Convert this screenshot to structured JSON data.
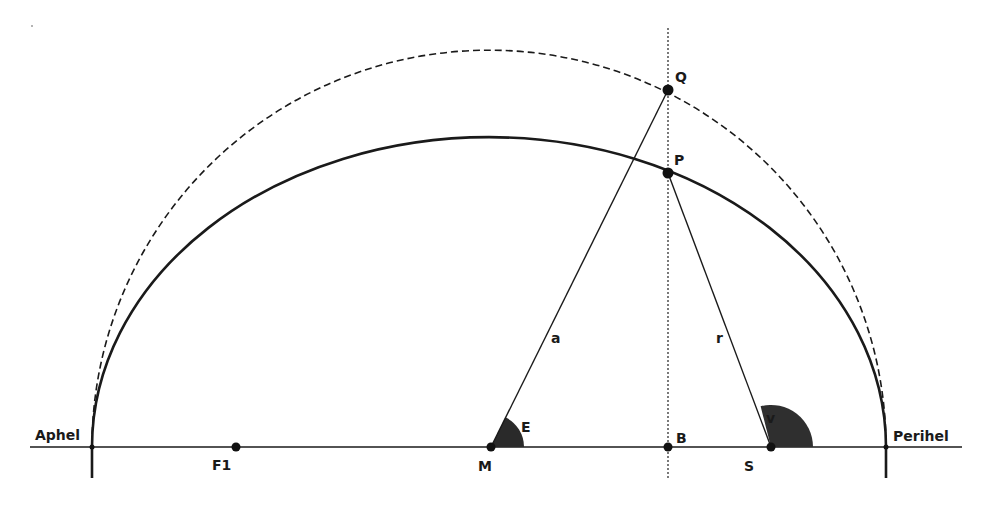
{
  "diagram": {
    "colors": {
      "line": "#1a1a1a",
      "angle_fill": "#333333",
      "background": "#ffffff"
    },
    "labels": {
      "aphel": "Aphel",
      "perihel": "Perihel",
      "f1": "F1",
      "m": "M",
      "b": "B",
      "s": "S",
      "q": "Q",
      "p": "P",
      "a": "a",
      "r": "r",
      "e": "E",
      "v": "v"
    },
    "elements": {
      "axis": {
        "x1": 30,
        "x2": 962,
        "y": 447
      },
      "center_M": {
        "x": 491,
        "y": 447
      },
      "focus_F1": {
        "x": 236,
        "y": 447
      },
      "focus_S": {
        "x": 771,
        "y": 447
      },
      "point_B": {
        "x": 668,
        "y": 447
      },
      "point_P": {
        "x": 668,
        "y": 173
      },
      "point_Q": {
        "x": 668,
        "y": 90
      },
      "aphel_point": {
        "x": 92,
        "y": 447
      },
      "perihel_point": {
        "x": 886,
        "y": 447
      },
      "auxiliary_circle": {
        "style": "dashed",
        "cx": 489,
        "cy": 447,
        "r": 397
      },
      "ellipse": {
        "style": "solid",
        "cx": 489,
        "cy": 447,
        "rx": 397,
        "ry": 310
      },
      "vertical_line": {
        "style": "dotted",
        "x": 668,
        "y1": 28,
        "y2": 480
      },
      "angle_E": {
        "vertex": "M",
        "radius": 33
      },
      "angle_v": {
        "vertex": "S",
        "radius": 42
      }
    }
  }
}
